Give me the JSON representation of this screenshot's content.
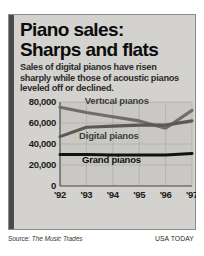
{
  "graphic": {
    "headline_line1": "Piano sales:",
    "headline_line2": "Sharps and flats",
    "deck": "Sales of digital pianos have risen sharply while those of acoustic pianos leveled off or declined."
  },
  "footer": {
    "source_lead": "Source: ",
    "source_name": "The Music Trades",
    "brand": "USA TODAY"
  },
  "colors": {
    "card_background": "#d3d2ce",
    "card_left_bar": "#4a4a48",
    "plot_background": "#c9c8c4",
    "gridline": "#b0afab",
    "axis": "#55544f",
    "vertical_pianos": "#6e6d69",
    "digital_pianos": "#5a5955",
    "grand_pianos": "#121212",
    "headline_text": "#0c0c0c",
    "deck_text": "#2b2b2b"
  },
  "chart_data": {
    "type": "line",
    "title": "Piano sales: Sharps and flats",
    "subtitle": "Sales of digital pianos have risen sharply while those of acoustic pianos leveled off or declined.",
    "xlabel": "",
    "ylabel": "",
    "x": [
      "'92",
      "'93",
      "'94",
      "'95",
      "'96",
      "'97"
    ],
    "categories": [
      "'92",
      "'93",
      "'94",
      "'95",
      "'96",
      "'97"
    ],
    "ylim": [
      0,
      80000
    ],
    "yticks": [
      0,
      20000,
      40000,
      60000,
      80000
    ],
    "ytick_labels": [
      "0",
      "20,000",
      "40,000",
      "60,000",
      "80,000"
    ],
    "grid": true,
    "legend": "inline-labels",
    "series": [
      {
        "name": "Vertical pianos",
        "values": [
          75000,
          70000,
          66000,
          62000,
          55000,
          72000
        ],
        "color": "#6e6d69"
      },
      {
        "name": "Digital pianos",
        "values": [
          47000,
          56000,
          57000,
          58000,
          58000,
          62000
        ],
        "color": "#5a5955"
      },
      {
        "name": "Grand pianos",
        "values": [
          30000,
          30000,
          29500,
          29500,
          29500,
          31000
        ],
        "color": "#121212"
      }
    ],
    "annotations": [
      {
        "text": "Vertical pianos",
        "series": "Vertical pianos"
      },
      {
        "text": "Digital pianos",
        "series": "Digital pianos"
      },
      {
        "text": "Grand pianos",
        "series": "Grand pianos"
      }
    ]
  }
}
